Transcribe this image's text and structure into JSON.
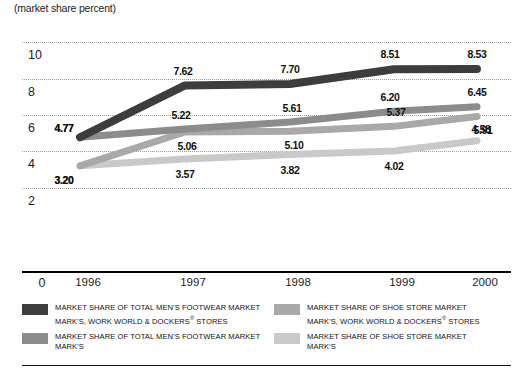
{
  "chart_data": {
    "type": "line",
    "title": "(market share percent)",
    "xlabel": "",
    "ylabel": "market share percent",
    "categories": [
      "1996",
      "1997",
      "1998",
      "1999",
      "2000"
    ],
    "ylim": [
      0,
      11
    ],
    "yticks": [
      2,
      4,
      6,
      8,
      10
    ],
    "grid": "horizontal-dotted",
    "legend_position": "bottom",
    "series": [
      {
        "name": "MARKET SHARE OF TOTAL MEN'S FOOTWEAR MARKET MARK'S, WORK WORLD & DOCKERS® STORES",
        "color": "#3d3d3d",
        "values": [
          4.77,
          7.62,
          7.7,
          8.51,
          8.53
        ],
        "labels": [
          "4.77",
          "7.62",
          "7.70",
          "8.51",
          "8.53"
        ]
      },
      {
        "name": "MARKET SHARE OF TOTAL MEN'S FOOTWEAR MARKET MARK'S",
        "color": "#8c8c8c",
        "values": [
          4.77,
          5.22,
          5.61,
          6.2,
          6.45
        ],
        "labels": [
          "4.77",
          "5.22",
          "5.61",
          "6.20",
          "6.45"
        ]
      },
      {
        "name": "MARKET SHARE OF SHOE STORE MARKET MARK'S, WORK WORLD & DOCKERS® STORES",
        "color": "#a9a9a9",
        "values": [
          3.2,
          5.06,
          5.1,
          5.37,
          5.91
        ],
        "labels": [
          "3.20",
          "5.06",
          "5.10",
          "5.37",
          "5.91"
        ]
      },
      {
        "name": "MARKET SHARE OF SHOE STORE MARKET MARK'S",
        "color": "#c9c9c9",
        "values": [
          3.2,
          3.57,
          3.82,
          4.02,
          4.58
        ],
        "labels": [
          "3.20",
          "3.57",
          "3.82",
          "4.02",
          "4.58"
        ]
      }
    ]
  },
  "axis": {
    "title": "(market share percent)",
    "y_ticks": [
      "10",
      "8",
      "6",
      "4",
      "2"
    ],
    "x_origin_label": "0",
    "x_ticks": [
      "1996",
      "1997",
      "1998",
      "1999",
      "2000"
    ]
  },
  "legend": {
    "items": [
      {
        "color": "#3d3d3d",
        "line1": "MARKET SHARE OF TOTAL MEN'S FOOTWEAR MARKET",
        "line2": "MARK'S, WORK WORLD & DOCKERS",
        "line2_sup": "®",
        "line2_tail": " STORES"
      },
      {
        "color": "#8c8c8c",
        "line1": "MARKET SHARE OF TOTAL MEN'S FOOTWEAR MARKET",
        "line2": "MARK'S",
        "line2_sup": "",
        "line2_tail": ""
      },
      {
        "color": "#a9a9a9",
        "line1": "MARKET SHARE OF SHOE STORE MARKET",
        "line2": "MARK'S, WORK WORLD & DOCKERS",
        "line2_sup": "®",
        "line2_tail": " STORES"
      },
      {
        "color": "#c9c9c9",
        "line1": "MARKET SHARE OF SHOE STORE MARKET",
        "line2": "MARK'S",
        "line2_sup": "",
        "line2_tail": ""
      }
    ]
  },
  "label_offsets": {
    "comment": "per-series per-point label placement relative to the data point, in px",
    "s0": [
      [
        -16,
        -9
      ],
      [
        -2,
        -14
      ],
      [
        0,
        -15
      ],
      [
        -4,
        -15
      ],
      [
        0,
        -15
      ]
    ],
    "s1": [
      [
        -16,
        -9
      ],
      [
        -4,
        -14
      ],
      [
        2,
        -14
      ],
      [
        -4,
        -14
      ],
      [
        0,
        -15
      ]
    ],
    "s2": [
      [
        -16,
        14
      ],
      [
        2,
        14
      ],
      [
        4,
        14
      ],
      [
        2,
        -14
      ],
      [
        6,
        13
      ]
    ],
    "s3": [
      [
        -16,
        14
      ],
      [
        0,
        15
      ],
      [
        0,
        15
      ],
      [
        0,
        15
      ],
      [
        4,
        -12
      ]
    ]
  }
}
